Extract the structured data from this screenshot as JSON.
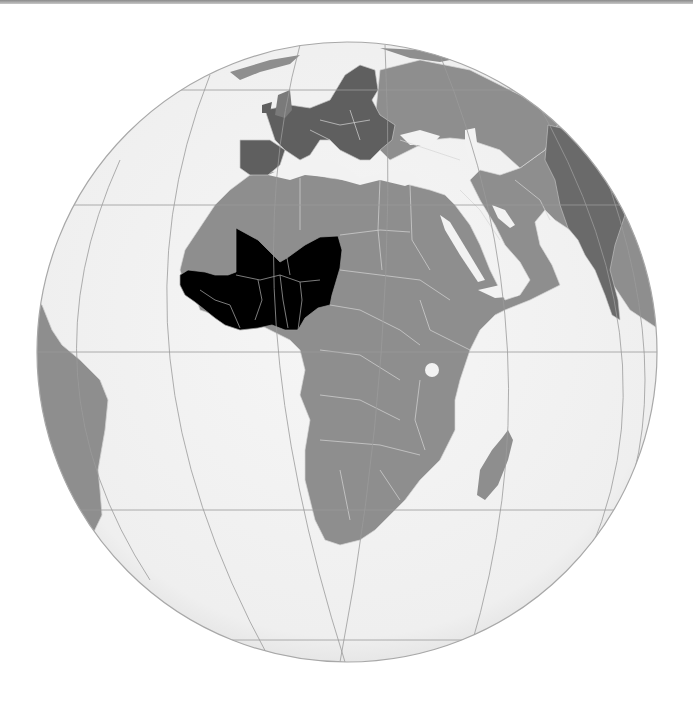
{
  "map": {
    "title": "West Africa (orthographic projection)",
    "projection": "orthographic",
    "highlighted_region": "West Africa",
    "colors": {
      "background": "#ffffff",
      "ocean": "#f2f2f2",
      "land": "#8e8e8e",
      "europe_dark": "#5f5f5f",
      "south_asia_dark": "#6a6a6a",
      "highlight": "#000000",
      "borders": "#d6d6d6",
      "graticule": "#9a9a9a",
      "top_border": "#8a8a8a"
    },
    "globe": {
      "cx": 347,
      "cy": 352,
      "r": 310
    },
    "visible_regions": [
      "Europe",
      "Africa",
      "Middle East",
      "Arabian Peninsula",
      "South Asia",
      "South America (east coast)",
      "Madagascar",
      "Antarctica"
    ]
  }
}
